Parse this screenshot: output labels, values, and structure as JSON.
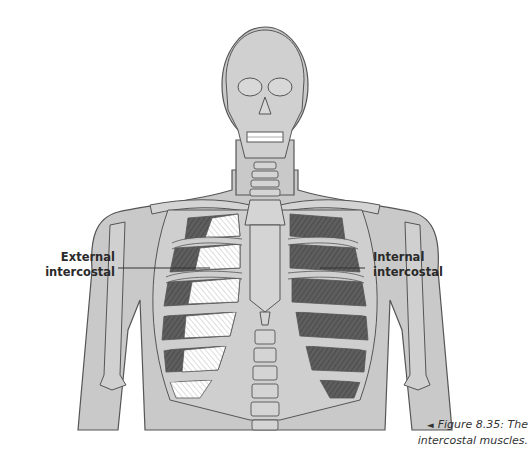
{
  "figure": {
    "labels": {
      "external": {
        "line1": "External",
        "line2": "intercostal"
      },
      "internal": {
        "line1": "Internal",
        "line2": "intercostal"
      }
    },
    "caption": {
      "arrow": "◄",
      "line1": "Figure 8.35: The",
      "line2": "intercostal muscles."
    },
    "colors": {
      "body_fill": "#c8c8c8",
      "bone_fill": "#d2d2d2",
      "outline": "#4a4a4a",
      "internal_muscle": "#5a5a5a",
      "external_muscle": "#ffffff",
      "background": "#ffffff"
    }
  }
}
